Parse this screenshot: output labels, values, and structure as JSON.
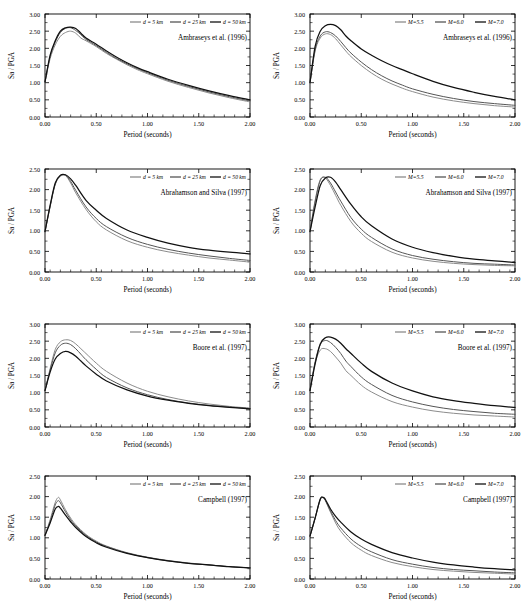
{
  "figure": {
    "columns": [
      "distance",
      "magnitude"
    ],
    "axis": {
      "xlabel": "Period (seconds)",
      "ylabel": "Sa / PGA",
      "xticks": [
        "0.00",
        "0.50",
        "1.00",
        "1.50",
        "2.00"
      ],
      "xlim": [
        0,
        2
      ],
      "yticks_3": [
        "0.00",
        "0.50",
        "1.00",
        "1.50",
        "2.00",
        "2.50",
        "3.00"
      ],
      "yticks_25": [
        "0.00",
        "0.50",
        "1.00",
        "1.50",
        "2.00",
        "2.50"
      ]
    },
    "legend_distance": [
      {
        "label": "d = 5 km",
        "color": "#8c8c8c"
      },
      {
        "label": "d = 25 km",
        "color": "#555555"
      },
      {
        "label": "d = 50 km",
        "color": "#111111"
      }
    ],
    "legend_magnitude": [
      {
        "label": "M=5.5",
        "color": "#8c8c8c"
      },
      {
        "label": "M=6.0",
        "color": "#555555"
      },
      {
        "label": "M=7.0",
        "color": "#111111"
      }
    ],
    "captions": {
      "ambraseys": "Ambraseys et al. (1996)",
      "abrahamson": "Abrahamson and Silva (1997)",
      "boore": "Boore et al. (1997)",
      "campbell": "Campbell (1997)"
    }
  },
  "chart_data": [
    {
      "id": "ambraseys-distance",
      "type": "line",
      "title": "Ambraseys et al. (1996)",
      "xlabel": "Period (seconds)",
      "ylabel": "Sa / PGA",
      "xlim": [
        0,
        2
      ],
      "ylim": [
        0,
        3
      ],
      "legend_position": "top-right",
      "grid": false,
      "x": [
        0.0,
        0.05,
        0.1,
        0.15,
        0.2,
        0.25,
        0.3,
        0.35,
        0.4,
        0.5,
        0.6,
        0.7,
        0.8,
        0.9,
        1.0,
        1.2,
        1.4,
        1.6,
        1.8,
        2.0
      ],
      "series": [
        {
          "name": "d = 5 km",
          "color": "#8c8c8c",
          "values": [
            1.02,
            1.7,
            2.1,
            2.35,
            2.46,
            2.5,
            2.44,
            2.3,
            2.22,
            2.05,
            1.85,
            1.68,
            1.52,
            1.38,
            1.26,
            1.04,
            0.86,
            0.7,
            0.56,
            0.44
          ]
        },
        {
          "name": "d = 25 km",
          "color": "#555555",
          "values": [
            1.02,
            1.76,
            2.18,
            2.46,
            2.58,
            2.6,
            2.52,
            2.4,
            2.26,
            2.08,
            1.88,
            1.7,
            1.55,
            1.41,
            1.29,
            1.07,
            0.89,
            0.73,
            0.59,
            0.47
          ]
        },
        {
          "name": "d = 50 km",
          "color": "#111111",
          "values": [
            1.02,
            1.8,
            2.22,
            2.5,
            2.6,
            2.62,
            2.58,
            2.44,
            2.3,
            2.12,
            1.92,
            1.74,
            1.58,
            1.44,
            1.32,
            1.1,
            0.92,
            0.76,
            0.62,
            0.5
          ]
        }
      ]
    },
    {
      "id": "ambraseys-magnitude",
      "type": "line",
      "title": "Ambraseys et al. (1996)",
      "xlabel": "Period (seconds)",
      "ylabel": "Sa / PGA",
      "xlim": [
        0,
        2
      ],
      "ylim": [
        0,
        3
      ],
      "legend_position": "top-right",
      "grid": false,
      "x": [
        0.0,
        0.05,
        0.1,
        0.15,
        0.2,
        0.25,
        0.3,
        0.35,
        0.4,
        0.5,
        0.6,
        0.7,
        0.8,
        0.9,
        1.0,
        1.2,
        1.4,
        1.6,
        1.8,
        2.0
      ],
      "series": [
        {
          "name": "M=5.5",
          "color": "#8c8c8c",
          "values": [
            1.0,
            1.92,
            2.3,
            2.42,
            2.4,
            2.28,
            2.1,
            1.92,
            1.76,
            1.5,
            1.28,
            1.1,
            0.96,
            0.84,
            0.74,
            0.58,
            0.47,
            0.39,
            0.33,
            0.29
          ]
        },
        {
          "name": "M=6.0",
          "color": "#555555",
          "values": [
            1.0,
            1.96,
            2.36,
            2.48,
            2.46,
            2.36,
            2.2,
            2.02,
            1.86,
            1.6,
            1.38,
            1.2,
            1.05,
            0.93,
            0.82,
            0.66,
            0.54,
            0.45,
            0.39,
            0.34
          ]
        },
        {
          "name": "M=7.0",
          "color": "#111111",
          "values": [
            1.0,
            2.06,
            2.5,
            2.66,
            2.7,
            2.66,
            2.54,
            2.36,
            2.22,
            1.98,
            1.8,
            1.64,
            1.5,
            1.38,
            1.26,
            1.04,
            0.86,
            0.72,
            0.6,
            0.5
          ]
        }
      ]
    },
    {
      "id": "abrahamson-distance",
      "type": "line",
      "title": "Abrahamson and Silva (1997)",
      "xlabel": "Period (seconds)",
      "ylabel": "Sa / PGA",
      "xlim": [
        0,
        2
      ],
      "ylim": [
        0,
        2.5
      ],
      "legend_position": "top-right",
      "grid": false,
      "x": [
        0.0,
        0.05,
        0.1,
        0.15,
        0.2,
        0.25,
        0.3,
        0.4,
        0.5,
        0.6,
        0.8,
        1.0,
        1.2,
        1.4,
        1.6,
        1.8,
        2.0
      ],
      "series": [
        {
          "name": "d = 5 km",
          "color": "#8c8c8c",
          "values": [
            0.98,
            1.58,
            2.12,
            2.32,
            2.34,
            2.16,
            1.92,
            1.52,
            1.22,
            1.02,
            0.76,
            0.6,
            0.49,
            0.41,
            0.34,
            0.29,
            0.24
          ]
        },
        {
          "name": "d = 25 km",
          "color": "#555555",
          "values": [
            0.98,
            1.6,
            2.14,
            2.34,
            2.35,
            2.2,
            1.98,
            1.58,
            1.3,
            1.1,
            0.84,
            0.67,
            0.55,
            0.46,
            0.39,
            0.33,
            0.28
          ]
        },
        {
          "name": "d = 50 km",
          "color": "#111111",
          "values": [
            0.98,
            1.62,
            2.16,
            2.35,
            2.36,
            2.26,
            2.1,
            1.74,
            1.5,
            1.3,
            1.02,
            0.84,
            0.7,
            0.6,
            0.53,
            0.48,
            0.44
          ]
        }
      ]
    },
    {
      "id": "abrahamson-magnitude",
      "type": "line",
      "title": "Abrahamson and Silva (1997)",
      "xlabel": "Period (seconds)",
      "ylabel": "Sa / PGA",
      "xlim": [
        0,
        2
      ],
      "ylim": [
        0,
        2.5
      ],
      "legend_position": "top-right",
      "grid": false,
      "x": [
        0.0,
        0.05,
        0.1,
        0.15,
        0.2,
        0.25,
        0.3,
        0.4,
        0.5,
        0.6,
        0.8,
        1.0,
        1.2,
        1.4,
        1.6,
        1.8,
        2.0
      ],
      "series": [
        {
          "name": "M=5.5",
          "color": "#8c8c8c",
          "values": [
            0.98,
            1.74,
            2.24,
            2.28,
            2.1,
            1.86,
            1.62,
            1.22,
            0.94,
            0.74,
            0.48,
            0.34,
            0.26,
            0.21,
            0.18,
            0.16,
            0.15
          ]
        },
        {
          "name": "M=6.0",
          "color": "#555555",
          "values": [
            0.98,
            1.7,
            2.22,
            2.3,
            2.16,
            1.94,
            1.72,
            1.32,
            1.04,
            0.84,
            0.56,
            0.4,
            0.31,
            0.25,
            0.21,
            0.19,
            0.17
          ]
        },
        {
          "name": "M=7.0",
          "color": "#111111",
          "values": [
            0.98,
            1.58,
            2.1,
            2.28,
            2.3,
            2.18,
            2.0,
            1.64,
            1.34,
            1.12,
            0.8,
            0.6,
            0.47,
            0.38,
            0.31,
            0.27,
            0.23
          ]
        }
      ]
    },
    {
      "id": "boore-distance",
      "type": "line",
      "title": "Boore et al. (1997)",
      "xlabel": "Period (seconds)",
      "ylabel": "Sa / PGA",
      "xlim": [
        0,
        2
      ],
      "ylim": [
        0,
        3
      ],
      "legend_position": "top-right",
      "grid": false,
      "x": [
        0.0,
        0.05,
        0.1,
        0.15,
        0.2,
        0.25,
        0.3,
        0.35,
        0.4,
        0.5,
        0.6,
        0.8,
        1.0,
        1.2,
        1.4,
        1.6,
        1.8,
        2.0
      ],
      "series": [
        {
          "name": "d = 5 km",
          "color": "#8c8c8c",
          "values": [
            1.06,
            1.7,
            2.26,
            2.48,
            2.54,
            2.52,
            2.42,
            2.28,
            2.14,
            1.86,
            1.62,
            1.28,
            1.04,
            0.88,
            0.76,
            0.67,
            0.6,
            0.55
          ]
        },
        {
          "name": "d = 25 km",
          "color": "#555555",
          "values": [
            1.06,
            1.66,
            2.16,
            2.38,
            2.44,
            2.4,
            2.28,
            2.12,
            1.96,
            1.68,
            1.44,
            1.14,
            0.94,
            0.8,
            0.7,
            0.63,
            0.58,
            0.54
          ]
        },
        {
          "name": "d = 50 km",
          "color": "#111111",
          "values": [
            1.06,
            1.6,
            1.98,
            2.14,
            2.2,
            2.16,
            2.06,
            1.92,
            1.78,
            1.54,
            1.34,
            1.08,
            0.9,
            0.78,
            0.69,
            0.62,
            0.57,
            0.53
          ]
        }
      ]
    },
    {
      "id": "boore-magnitude",
      "type": "line",
      "title": "Boore et al. (1997)",
      "xlabel": "Period (seconds)",
      "ylabel": "Sa / PGA",
      "xlim": [
        0,
        2
      ],
      "ylim": [
        0,
        3
      ],
      "legend_position": "top-right",
      "grid": false,
      "x": [
        0.0,
        0.05,
        0.1,
        0.15,
        0.2,
        0.25,
        0.3,
        0.35,
        0.4,
        0.5,
        0.6,
        0.8,
        1.0,
        1.2,
        1.4,
        1.6,
        1.8,
        2.0
      ],
      "series": [
        {
          "name": "M=5.5",
          "color": "#8c8c8c",
          "values": [
            1.06,
            1.86,
            2.24,
            2.28,
            2.2,
            2.04,
            1.86,
            1.64,
            1.5,
            1.22,
            1.02,
            0.74,
            0.58,
            0.47,
            0.4,
            0.35,
            0.32,
            0.29
          ]
        },
        {
          "name": "M=6.0",
          "color": "#555555",
          "values": [
            1.06,
            1.9,
            2.4,
            2.52,
            2.46,
            2.32,
            2.14,
            1.92,
            1.76,
            1.46,
            1.24,
            0.92,
            0.73,
            0.6,
            0.51,
            0.45,
            0.4,
            0.37
          ]
        },
        {
          "name": "M=7.0",
          "color": "#111111",
          "values": [
            1.06,
            1.84,
            2.42,
            2.6,
            2.62,
            2.56,
            2.44,
            2.28,
            2.14,
            1.86,
            1.62,
            1.28,
            1.05,
            0.88,
            0.77,
            0.69,
            0.62,
            0.57
          ]
        }
      ]
    },
    {
      "id": "campbell-distance",
      "type": "line",
      "title": "Campbell (1997)",
      "xlabel": "Period (seconds)",
      "ylabel": "Sa / PGA",
      "xlim": [
        0,
        2
      ],
      "ylim": [
        0,
        2.5
      ],
      "legend_position": "top-right",
      "grid": false,
      "x": [
        0.0,
        0.05,
        0.1,
        0.13,
        0.15,
        0.2,
        0.25,
        0.3,
        0.4,
        0.5,
        0.6,
        0.8,
        1.0,
        1.2,
        1.4,
        1.6,
        1.8,
        2.0
      ],
      "series": [
        {
          "name": "d = 5 km",
          "color": "#8c8c8c",
          "values": [
            1.06,
            1.44,
            1.86,
            1.98,
            1.92,
            1.68,
            1.48,
            1.32,
            1.08,
            0.92,
            0.8,
            0.64,
            0.53,
            0.45,
            0.39,
            0.34,
            0.3,
            0.27
          ]
        },
        {
          "name": "d = 25 km",
          "color": "#555555",
          "values": [
            1.06,
            1.4,
            1.8,
            1.9,
            1.85,
            1.63,
            1.44,
            1.29,
            1.06,
            0.9,
            0.79,
            0.63,
            0.52,
            0.44,
            0.38,
            0.34,
            0.3,
            0.27
          ]
        },
        {
          "name": "d = 50 km",
          "color": "#111111",
          "values": [
            1.06,
            1.36,
            1.7,
            1.76,
            1.72,
            1.55,
            1.39,
            1.25,
            1.03,
            0.88,
            0.77,
            0.62,
            0.52,
            0.44,
            0.38,
            0.34,
            0.3,
            0.27
          ]
        }
      ]
    },
    {
      "id": "campbell-magnitude",
      "type": "line",
      "title": "Campbell (1997)",
      "xlabel": "Period (seconds)",
      "ylabel": "Sa / PGA",
      "xlim": [
        0,
        2
      ],
      "ylim": [
        0,
        2.5
      ],
      "legend_position": "top-right",
      "grid": false,
      "x": [
        0.0,
        0.05,
        0.1,
        0.13,
        0.15,
        0.2,
        0.25,
        0.3,
        0.4,
        0.5,
        0.6,
        0.8,
        1.0,
        1.2,
        1.4,
        1.6,
        1.8,
        2.0
      ],
      "series": [
        {
          "name": "M=5.5",
          "color": "#8c8c8c",
          "values": [
            1.04,
            1.48,
            1.92,
            1.97,
            1.9,
            1.62,
            1.36,
            1.16,
            0.88,
            0.7,
            0.57,
            0.4,
            0.3,
            0.23,
            0.19,
            0.16,
            0.14,
            0.12
          ]
        },
        {
          "name": "M=6.0",
          "color": "#555555",
          "values": [
            1.04,
            1.48,
            1.93,
            1.97,
            1.91,
            1.65,
            1.42,
            1.24,
            0.97,
            0.79,
            0.66,
            0.47,
            0.36,
            0.28,
            0.23,
            0.2,
            0.17,
            0.15
          ]
        },
        {
          "name": "M=7.0",
          "color": "#111111",
          "values": [
            1.04,
            1.48,
            1.94,
            1.98,
            1.93,
            1.7,
            1.52,
            1.38,
            1.14,
            0.97,
            0.84,
            0.64,
            0.51,
            0.41,
            0.34,
            0.29,
            0.25,
            0.22
          ]
        }
      ]
    }
  ]
}
